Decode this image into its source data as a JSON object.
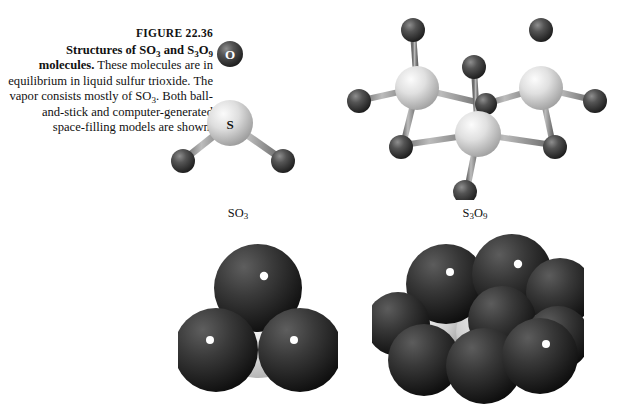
{
  "figure": {
    "number_label": "FIGURE 22.36",
    "caption_lead": "Structures of SO3 and S3O9 molecules.",
    "caption_rest": " These molecules are in equilibrium in liquid sulfur trioxide. The vapor consists mostly of SO3. Both ball-and-stick and computer-generated space-filling models are shown."
  },
  "labels": {
    "so3": "SO3",
    "s3o9": "S3O9"
  },
  "atom_labels": {
    "sulfur": "S",
    "oxygen": "O"
  },
  "colors": {
    "sulfur_light": "#d8d8d8",
    "sulfur_mid": "#b4b4b4",
    "oxygen_dark": "#474747",
    "oxygen_darker": "#2e2e2e",
    "bond_gray": "#8c8c8c",
    "background": "#ffffff",
    "text": "#111111"
  },
  "chart_data": {
    "type": "diagram",
    "title": "Structures of SO3 and S3O9 molecules",
    "models": [
      {
        "name": "SO3",
        "style": "ball-and-stick",
        "sulfur_count": 1,
        "oxygen_count": 3,
        "geometry": "trigonal planar",
        "labeled_atoms": [
          "S",
          "O"
        ]
      },
      {
        "name": "S3O9",
        "style": "ball-and-stick",
        "sulfur_count": 3,
        "oxygen_count": 9,
        "geometry": "six-membered S-O ring with two terminal O per S",
        "labeled_atoms": []
      },
      {
        "name": "SO3",
        "style": "space-filling",
        "sulfur_count": 1,
        "oxygen_count": 3
      },
      {
        "name": "S3O9",
        "style": "space-filling",
        "sulfur_count": 3,
        "oxygen_count": 9
      }
    ]
  }
}
